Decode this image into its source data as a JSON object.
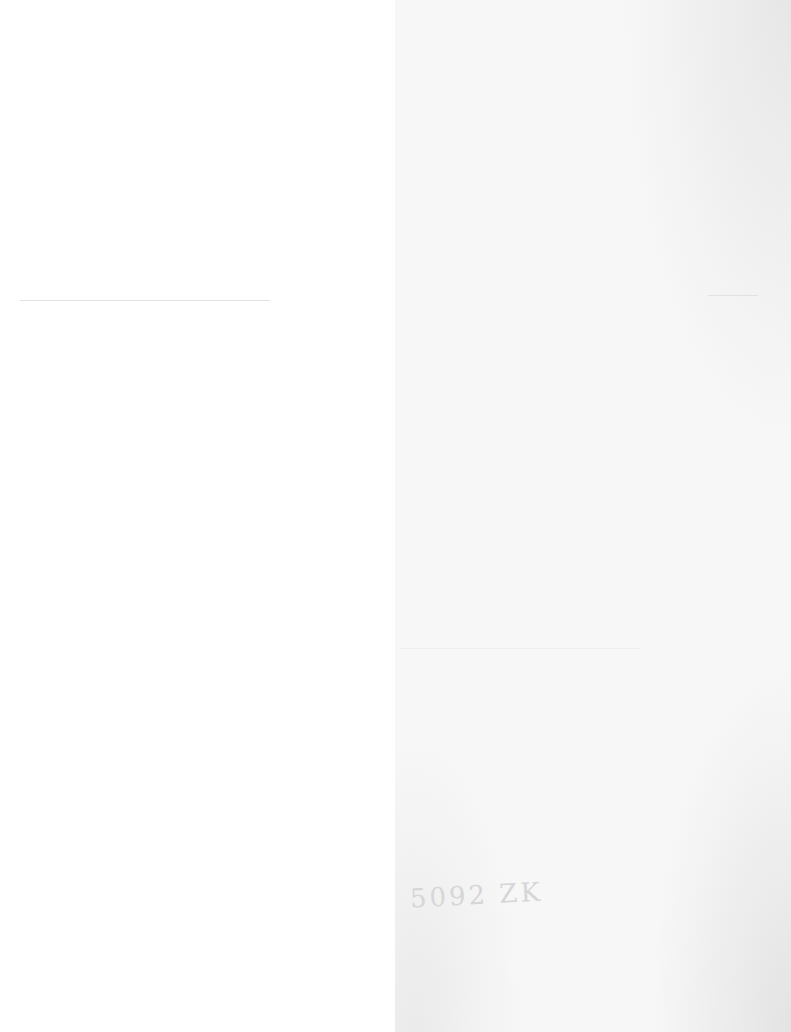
{
  "page": {
    "type": "scanned blank page",
    "handwritten_note": "5092 ZK"
  }
}
